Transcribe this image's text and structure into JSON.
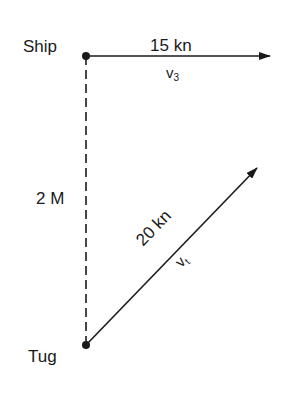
{
  "diagram": {
    "type": "relative-velocity vector diagram",
    "nodes": {
      "ship": {
        "label": "Ship"
      },
      "tug": {
        "label": "Tug"
      }
    },
    "distance": {
      "label": "2 M"
    },
    "ship_vector": {
      "speed_label": "15 kn",
      "symbol": "v",
      "subscript": "3",
      "direction": "east"
    },
    "tug_vector": {
      "speed_label": "20 kn",
      "symbol": "v",
      "subscript": "t",
      "direction": "north-east"
    },
    "colors": {
      "ink": "#1a1a1a",
      "background": "#ffffff"
    }
  }
}
